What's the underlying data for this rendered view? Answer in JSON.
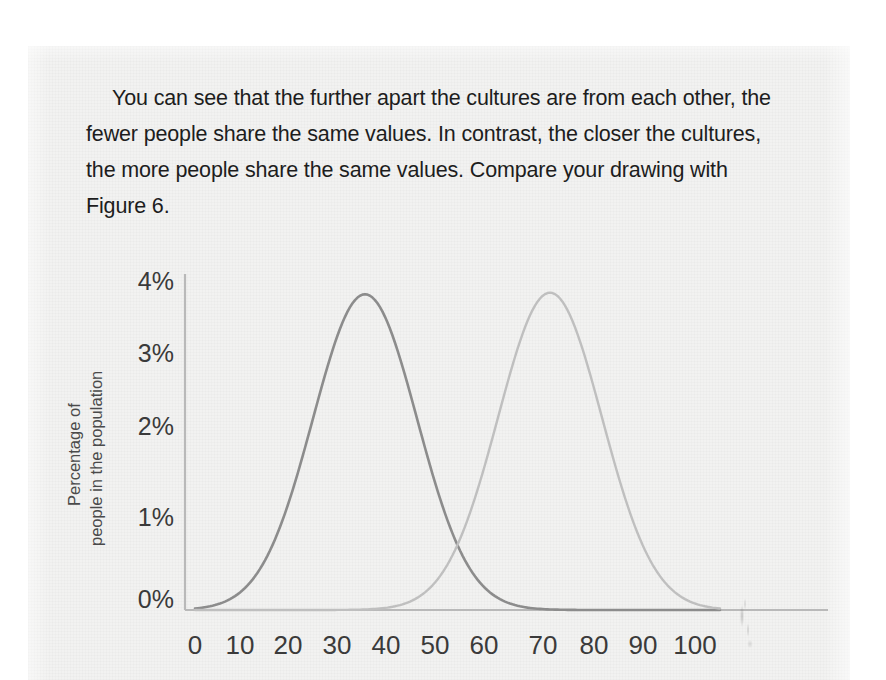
{
  "document": {
    "paragraph": "You can see that the further apart the cultures are from each other, the fewer people share the same values. In contrast, the closer the cultures, the more people share the same values. Compare your drawing with Figure 6."
  },
  "chart_data": {
    "type": "line",
    "title": "",
    "xlabel": "",
    "ylabel": "Percentage of people in the population",
    "ylabel_line1": "Percentage of",
    "ylabel_line2": "people in the population",
    "xlim": [
      0,
      105
    ],
    "ylim": [
      0,
      4
    ],
    "grid": false,
    "legend": false,
    "xticks": [
      "0",
      "10",
      "20",
      "30",
      "40",
      "50",
      "60",
      "70",
      "80",
      "90",
      "100"
    ],
    "xtick_values": [
      0,
      10,
      20,
      30,
      40,
      50,
      60,
      70,
      80,
      90,
      100
    ],
    "yticks": [
      "0%",
      "1%",
      "2%",
      "3%",
      "4%"
    ],
    "ytick_values": [
      0,
      1,
      2,
      3,
      4
    ],
    "series": [
      {
        "name": "Culture A",
        "color": "#8c8c8c",
        "peak_x": 34,
        "peak_y": 3.85,
        "sigma": 10.4,
        "x": [
          0,
          5,
          10,
          15,
          20,
          25,
          30,
          34,
          40,
          45,
          50,
          55,
          60,
          65,
          70,
          75,
          80,
          85,
          90,
          95,
          100,
          105
        ],
        "values": [
          0.06,
          0.16,
          0.36,
          0.73,
          1.31,
          2.08,
          3.23,
          3.85,
          3.23,
          2.08,
          1.31,
          0.73,
          0.36,
          0.16,
          0.06,
          0.02,
          0.01,
          0.0,
          0.0,
          0.0,
          0.0,
          0.0
        ]
      },
      {
        "name": "Culture B",
        "color": "#bfbfbf",
        "peak_x": 71,
        "peak_y": 3.87,
        "sigma": 10.4,
        "x": [
          0,
          5,
          10,
          15,
          20,
          25,
          30,
          35,
          40,
          45,
          50,
          55,
          60,
          65,
          71,
          77,
          82,
          87,
          92,
          97,
          100,
          105
        ],
        "values": [
          0.0,
          0.0,
          0.0,
          0.0,
          0.0,
          0.01,
          0.02,
          0.06,
          0.16,
          0.36,
          0.73,
          1.31,
          2.08,
          3.23,
          3.87,
          3.23,
          2.08,
          1.31,
          0.73,
          0.36,
          0.22,
          0.06
        ]
      }
    ],
    "annotations": [
      {
        "name": "curve-crossing",
        "x": 52.5,
        "y": 1.0
      }
    ]
  }
}
